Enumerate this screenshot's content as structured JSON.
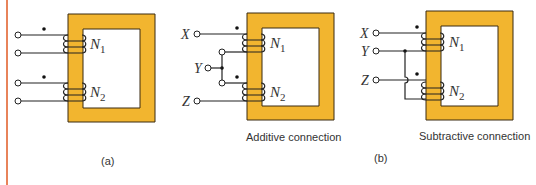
{
  "colors": {
    "core_fill": "#f2b52f",
    "core_stroke": "#3a2a10",
    "wire": "#222222",
    "page_rule": "#e8835a"
  },
  "panel_a": {
    "winding_labels": [
      "N",
      "N"
    ],
    "winding_subscripts": [
      "1",
      "2"
    ],
    "caption": "(a)"
  },
  "panel_b_additive": {
    "terminal_labels": [
      "X",
      "Y",
      "Z"
    ],
    "winding_labels": [
      "N",
      "N"
    ],
    "winding_subscripts": [
      "1",
      "2"
    ],
    "caption": "Additive connection"
  },
  "panel_b_subtractive": {
    "terminal_labels": [
      "X",
      "Y",
      "Z"
    ],
    "winding_labels": [
      "N",
      "N"
    ],
    "winding_subscripts": [
      "1",
      "2"
    ],
    "caption": "Subtractive connection"
  },
  "figure_label_b": "(b)"
}
